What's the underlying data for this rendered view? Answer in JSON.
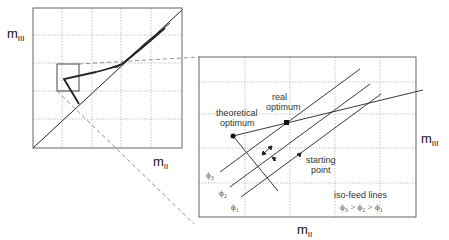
{
  "overview_plot": {
    "y_axis_label": "m",
    "y_axis_sub": "III",
    "x_axis_label": "m",
    "x_axis_sub": "II"
  },
  "detail_plot": {
    "y_axis_label": "m",
    "y_axis_sub": "III",
    "x_axis_label": "m",
    "x_axis_sub": "II",
    "annotations": {
      "theoretical_optimum_line1": "theoretical",
      "theoretical_optimum_line2": "optimum",
      "real_optimum_line1": "real",
      "real_optimum_line2": "optimum",
      "starting_point_line1": "starting",
      "starting_point_line2": "point",
      "legend_title": "iso-feed lines",
      "legend_relation": "ϕ₃ > ϕ₂ > ϕ₁"
    },
    "iso_feed_lines": [
      {
        "label": "ϕ₃"
      },
      {
        "label": "ϕ₂"
      },
      {
        "label": "ϕ₁"
      }
    ]
  },
  "colors": {
    "line": "#222222",
    "grid": "#aaaaaa",
    "frame": "#555555",
    "connector": "#777777"
  }
}
